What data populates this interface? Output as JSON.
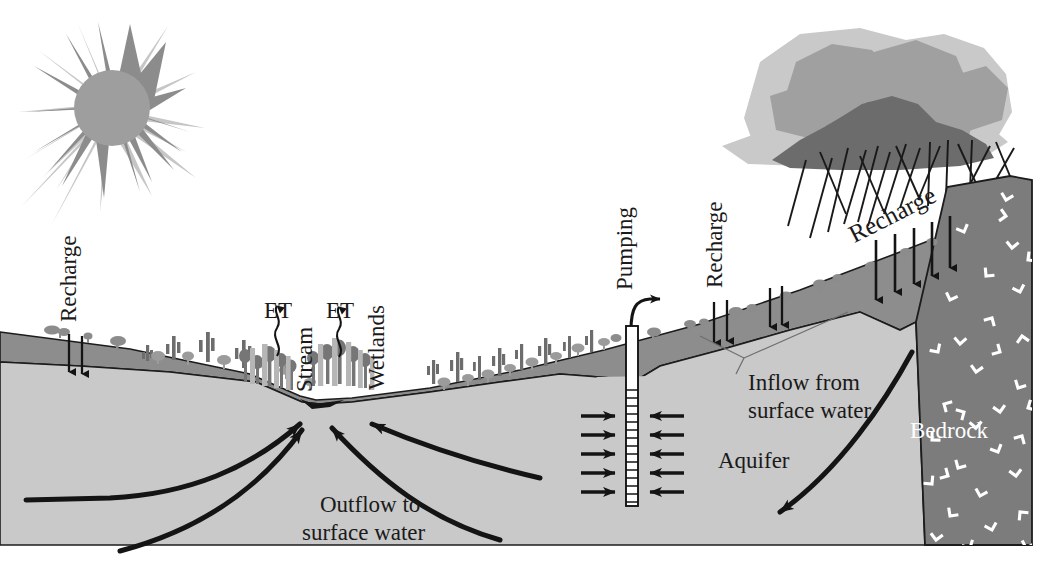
{
  "figure": {
    "kind": "hydrogeologic-cross-section",
    "title_visible": false
  },
  "palette": {
    "background": "#ffffff",
    "unsaturated_zone": "#8f8f8f",
    "aquifer": "#c9c9c9",
    "bedrock": "#7b7b7b",
    "bedrock_symbol": "#ffffff",
    "sun_core": "#9a9a9a",
    "sun_rays_dark": "#8a8a8a",
    "sun_rays_light": "#c4c4c4",
    "cloud_light": "#c8c8c8",
    "cloud_mid": "#9e9e9e",
    "cloud_dark": "#6e6e6e",
    "ink": "#1a1a1a",
    "vegetation_dark": "#6f6f6f",
    "vegetation_mid": "#9b9b9b",
    "vegetation_light": "#c0c0c0"
  },
  "labels": {
    "recharge_left": "Recharge",
    "et_left": "ET",
    "stream": "Stream",
    "et_right": "ET",
    "wetlands": "Wetlands",
    "pumping": "Pumping",
    "recharge_mid": "Recharge",
    "recharge_right": "Recharge",
    "inflow_line1": "Inflow from",
    "inflow_line2": "surface water",
    "aquifer": "Aquifer",
    "bedrock": "Bedrock",
    "outflow_line1": "Outflow to",
    "outflow_line2": "surface water"
  },
  "label_orientation": {
    "recharge_left": "vertical",
    "et_left": "horizontal",
    "stream": "vertical",
    "et_right": "horizontal",
    "wetlands": "vertical",
    "pumping": "vertical",
    "recharge_mid": "vertical",
    "recharge_right": "rotated-slope",
    "inflow": "horizontal",
    "aquifer": "horizontal",
    "bedrock": "horizontal",
    "outflow": "horizontal"
  },
  "icons": {
    "sun": "sun-icon",
    "cloud": "rain-cloud-icon",
    "rain": "rain-streaks-icon",
    "well": "pumping-well-icon",
    "well_screen": "well-screen-icon",
    "discharge_arrow": "pumping-discharge-arrow-icon",
    "recharge_arrow": "recharge-down-arrow-icon",
    "et_arrow": "evapotranspiration-wavy-arrow-icon",
    "flow_arrow": "groundwater-flow-arrow-icon",
    "bedrock_chevron": "bedrock-chevron-icon",
    "cactus": "cactus-icon",
    "shrub": "shrub-icon",
    "tree": "tree-icon",
    "leader_line": "leader-line-icon"
  },
  "counts": {
    "recharge_arrows_left": 2,
    "recharge_arrows_mid": 4,
    "recharge_arrows_right": 5,
    "well_inflow_arrows_left": 5,
    "well_inflow_arrows_right": 5,
    "outflow_arrows": 4,
    "et_arrows": 2,
    "rain_streaks": 18,
    "bedrock_chevrons": 34
  },
  "flow_directions": {
    "recharge": "downward",
    "evapotranspiration": "upward",
    "well_capture": "horizontal-converging",
    "outflow_to_stream": "upward-converging",
    "mountain_front_inflow": "down-and-left"
  }
}
